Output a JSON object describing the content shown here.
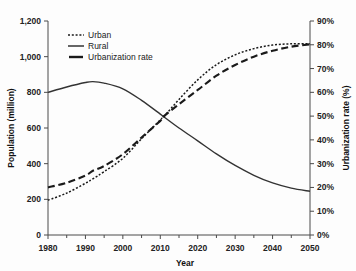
{
  "chart_data": {
    "type": "line",
    "title": "",
    "xlabel": "Year",
    "ylabel": "Population (million)",
    "y2label": "Urbanization rate (%)",
    "grid": false,
    "legend_position": "top-left",
    "xlim": [
      1980,
      2050
    ],
    "ylim": [
      0,
      1200
    ],
    "y2lim": [
      0,
      90
    ],
    "xticks": [
      "1980",
      "1990",
      "2000",
      "2010",
      "2020",
      "2030",
      "2040",
      "2050"
    ],
    "xtick_values": [
      1980,
      1990,
      2000,
      2010,
      2020,
      2030,
      2040,
      2050
    ],
    "yticks": [
      "0",
      "200",
      "400",
      "600",
      "800",
      "1,000",
      "1,200"
    ],
    "ytick_values": [
      0,
      200,
      400,
      600,
      800,
      1000,
      1200
    ],
    "y2ticks": [
      "0%",
      "10%",
      "20%",
      "30%",
      "40%",
      "50%",
      "60%",
      "70%",
      "80%",
      "90%"
    ],
    "y2tick_values": [
      0,
      10,
      20,
      30,
      40,
      50,
      60,
      70,
      80,
      90
    ],
    "x": [
      1980,
      1985,
      1990,
      1992,
      1995,
      2000,
      2005,
      2010,
      2011,
      2015,
      2020,
      2025,
      2030,
      2035,
      2040,
      2045,
      2050
    ],
    "series": [
      {
        "name": "Urban",
        "axis": "left",
        "style": "dotted",
        "values": [
          195,
          235,
          290,
          315,
          355,
          430,
          540,
          645,
          665,
          760,
          870,
          955,
          1010,
          1045,
          1065,
          1072,
          1072
        ]
      },
      {
        "name": "Rural",
        "axis": "left",
        "style": "solid",
        "values": [
          800,
          830,
          855,
          860,
          852,
          820,
          755,
          678,
          662,
          600,
          528,
          455,
          390,
          335,
          292,
          263,
          245
        ]
      },
      {
        "name": "Urbanization rate",
        "axis": "right",
        "style": "dashed",
        "values": [
          20,
          22,
          25,
          27,
          29,
          34,
          41,
          48,
          50,
          55,
          61,
          67,
          71.5,
          75,
          77.5,
          79.2,
          80.2
        ]
      }
    ],
    "legend": [
      "Urban",
      "Rural",
      "Urbanization rate"
    ],
    "colors": {
      "urban": "#1a1a1a",
      "rural": "#333333",
      "urbanization_rate": "#1a1a1a",
      "axis": "#4a4a4a",
      "background": "#fdfdfd"
    }
  }
}
